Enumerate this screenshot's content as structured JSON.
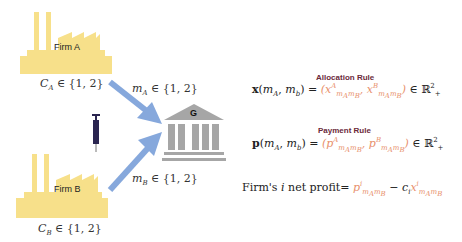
{
  "firms": [
    {
      "label": "Firm A",
      "cost": "C_A ∈ {1, 2}",
      "message": "m_A ∈ {1, 2}"
    },
    {
      "label": "Firm B",
      "cost": "C_B ∈ {1, 2}",
      "message": "m_B ∈ {1, 2}"
    }
  ],
  "government": {
    "label": "G"
  },
  "allocation": {
    "title": "Allocation Rule",
    "lhs": "x(m_A, m_b) = ",
    "rhs_open": "(",
    "term_a": "x^A_{m_A m_B}",
    "term_b": "x^B_{m_A m_B}",
    "rhs_close": ") ∈ ℝ²₊"
  },
  "payment": {
    "title": "Payment Rule",
    "lhs": "p(m_A, m_b) = ",
    "rhs_open": "(",
    "term_a": "p^A_{m_A m_B}",
    "term_b": "p^B_{m_A m_B}",
    "rhs_close": ") ∈ ℝ²₊"
  },
  "profit": {
    "prefix": "Firm's i net profit= ",
    "term_p": "p^i_{m_A m_B}",
    "minus": " − c_i",
    "term_x": "x^i_{m_A m_B}"
  },
  "colors": {
    "factory": "#f7e08a",
    "arrow": "#86a8dc",
    "bank": "#a6a6a6",
    "highlight": "#e8906c",
    "rule_title": "#6b2a3a"
  }
}
